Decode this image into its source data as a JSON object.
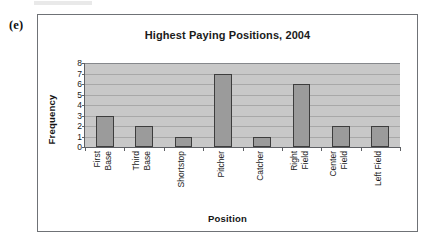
{
  "figure": {
    "part_label": "(e)"
  },
  "chart_data": {
    "type": "bar",
    "title": "Highest Paying Positions, 2004",
    "xlabel": "Position",
    "ylabel": "Frequency",
    "categories": [
      "First Base",
      "Third Base",
      "Shortstop",
      "Pitcher",
      "Catcher",
      "Right Field",
      "Center Field",
      "Left Field"
    ],
    "category_lines": [
      [
        "First",
        "Base"
      ],
      [
        "Third",
        "Base"
      ],
      [
        "Shortstop"
      ],
      [
        "Pitcher"
      ],
      [
        "Catcher"
      ],
      [
        "Right",
        "Field"
      ],
      [
        "Center",
        "Field"
      ],
      [
        "Left Field"
      ]
    ],
    "values": [
      3,
      2,
      1,
      7,
      1,
      6,
      2,
      2
    ],
    "ylim": [
      0,
      8
    ],
    "ytick_step": 1,
    "yticks": [
      0,
      1,
      2,
      3,
      4,
      5,
      6,
      7,
      8
    ],
    "grid": true,
    "legend": false,
    "colors": {
      "bar_fill": "#9b9b9b",
      "bar_border": "#3d3d3d",
      "plot_background": "#c8c8c8",
      "gridline": "#a8a8a8",
      "axis": "#5e6064",
      "frame": "#6f7276",
      "text": "#1a1a1a"
    }
  }
}
